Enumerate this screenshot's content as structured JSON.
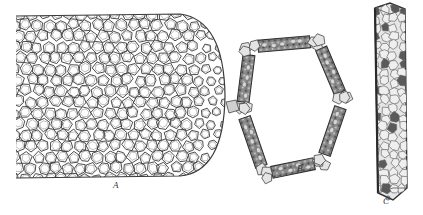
{
  "figure": {
    "panels": [
      {
        "id": "A",
        "label": "A",
        "subject": "cylindrical mass of polygonal cells with rounded end (honeycomb network)"
      },
      {
        "id": "B",
        "label": "B",
        "subject": "hexagonal ring of elongated cells with polygonal junction cells"
      },
      {
        "id": "C",
        "label": "C",
        "subject": "elongated prismatic cell with granular contents"
      }
    ],
    "colors": {
      "ink": "#3a3a3a",
      "light_ink": "#7a7a7a",
      "paper": "#ffffff",
      "dark_fill": "#5a5a5a",
      "mid_fill": "#9a9a9a",
      "light_fill": "#d8d8d8"
    }
  }
}
